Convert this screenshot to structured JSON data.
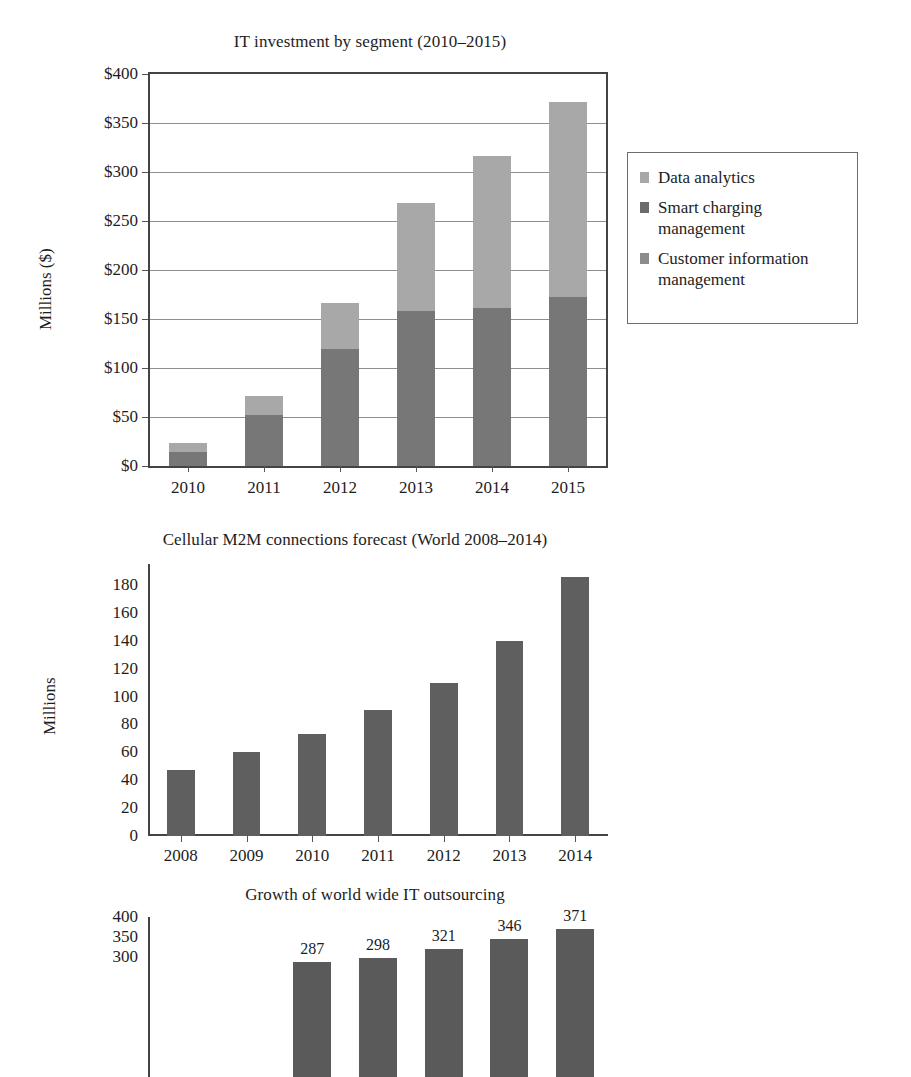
{
  "chart_data": [
    {
      "type": "bar",
      "subtype": "stacked-bar",
      "title": "IT investment by segment (2010–2015)",
      "xlabel": "",
      "ylabel": "Millions ($)",
      "categories": [
        "2010",
        "2011",
        "2012",
        "2013",
        "2014",
        "2015"
      ],
      "ytick_labels": [
        "$0",
        "$50",
        "$100",
        "$150",
        "$200",
        "$250",
        "$300",
        "$350",
        "$400"
      ],
      "ytick_values": [
        0,
        50,
        100,
        150,
        200,
        250,
        300,
        350,
        400
      ],
      "ylim": [
        0,
        400
      ],
      "grid": true,
      "legend_position": "right",
      "series": [
        {
          "name": "Customer information management",
          "color": "#777777",
          "values": [
            14,
            52,
            119,
            158,
            161,
            172
          ]
        },
        {
          "name": "Smart charging management",
          "color": "#6b6b6b",
          "values": [
            0,
            0,
            0,
            0,
            0,
            0
          ]
        },
        {
          "name": "Data analytics",
          "color": "#a8a8a8",
          "values": [
            9,
            19,
            47,
            110,
            155,
            199
          ]
        }
      ],
      "stack_totals": [
        23,
        71,
        166,
        268,
        316,
        371
      ]
    },
    {
      "type": "bar",
      "title": "Cellular M2M connections forecast (World 2008–2014)",
      "xlabel": "",
      "ylabel": "Millions",
      "categories": [
        "2008",
        "2009",
        "2010",
        "2011",
        "2012",
        "2013",
        "2014"
      ],
      "values": [
        47,
        60,
        73,
        90,
        110,
        140,
        186
      ],
      "ytick_labels": [
        "0",
        "20",
        "40",
        "60",
        "80",
        "100",
        "120",
        "140",
        "160",
        "180"
      ],
      "ytick_values": [
        0,
        20,
        40,
        60,
        80,
        100,
        120,
        140,
        160,
        180
      ],
      "ylim": [
        0,
        195
      ],
      "grid": false,
      "bar_color": "#5f5f5f"
    },
    {
      "type": "bar",
      "title": "Growth of world wide IT outsourcing",
      "xlabel": "",
      "ylabel": "",
      "categories": [
        "",
        "",
        "",
        "",
        "",
        ""
      ],
      "values": [
        null,
        null,
        287,
        298,
        321,
        346,
        371
      ],
      "data_labels": [
        "287",
        "298",
        "321",
        "346",
        "371"
      ],
      "ytick_labels": [
        "400",
        "350",
        "300"
      ],
      "ytick_values": [
        400,
        350,
        300
      ],
      "ylim": [
        0,
        400
      ],
      "grid": false,
      "bar_color": "#5a5a5a",
      "note": "chart is cropped by the bottom edge of the screenshot"
    }
  ],
  "charts": {
    "chart1": {
      "title": "IT investment by segment (2010–2015)",
      "ylabel": "Millions ($)"
    },
    "chart2": {
      "title": "Cellular M2M connections forecast (World 2008–2014)",
      "ylabel": "Millions"
    },
    "chart3": {
      "title": "Growth of world wide IT outsourcing"
    }
  },
  "legend": {
    "items": [
      {
        "label": "Data analytics",
        "color": "#a8a8a8"
      },
      {
        "label": "Smart charging\nmanagement",
        "color": "#6b6b6b"
      },
      {
        "label": "Customer information\nmanagement",
        "color": "#8c8c8c"
      }
    ]
  },
  "colors": {
    "data_analytics": "#a8a8a8",
    "smart_charging": "#6b6b6b",
    "customer_info": "#777777",
    "chart2_bar": "#5f5f5f",
    "chart3_bar": "#5a5a5a",
    "axis": "#444444",
    "gridline": "#8e8e8e",
    "text": "#1d1d1d",
    "background": "#ffffff"
  }
}
